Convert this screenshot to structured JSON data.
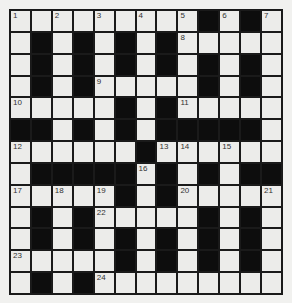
{
  "puzzle": {
    "type": "crossword",
    "size": [
      13,
      13
    ],
    "colors": {
      "white_cell": "#ececea",
      "black_cell": "#0d0d0d",
      "background": "#f1f1ef"
    },
    "grid": [
      [
        0,
        0,
        0,
        0,
        0,
        0,
        0,
        0,
        0,
        1,
        0,
        1,
        0
      ],
      [
        0,
        1,
        0,
        1,
        0,
        1,
        0,
        1,
        0,
        0,
        0,
        0,
        0
      ],
      [
        0,
        1,
        0,
        1,
        0,
        1,
        0,
        1,
        0,
        1,
        0,
        1,
        0
      ],
      [
        0,
        1,
        0,
        1,
        0,
        0,
        0,
        0,
        0,
        1,
        0,
        1,
        0
      ],
      [
        0,
        0,
        0,
        0,
        0,
        1,
        0,
        1,
        0,
        0,
        0,
        0,
        0
      ],
      [
        1,
        1,
        0,
        1,
        0,
        1,
        0,
        1,
        1,
        1,
        1,
        1,
        0
      ],
      [
        0,
        0,
        0,
        0,
        0,
        0,
        1,
        0,
        0,
        0,
        0,
        0,
        0
      ],
      [
        0,
        1,
        1,
        1,
        1,
        1,
        0,
        1,
        0,
        1,
        0,
        1,
        1
      ],
      [
        0,
        0,
        0,
        0,
        0,
        1,
        0,
        1,
        0,
        0,
        0,
        0,
        0
      ],
      [
        0,
        1,
        0,
        1,
        0,
        0,
        0,
        0,
        0,
        1,
        0,
        1,
        0
      ],
      [
        0,
        1,
        0,
        1,
        0,
        1,
        0,
        1,
        0,
        1,
        0,
        1,
        0
      ],
      [
        0,
        0,
        0,
        0,
        0,
        1,
        0,
        1,
        0,
        1,
        0,
        1,
        0
      ],
      [
        0,
        1,
        0,
        1,
        0,
        0,
        0,
        0,
        0,
        0,
        0,
        0,
        0
      ]
    ],
    "numbers": [
      {
        "n": "1",
        "r": 0,
        "c": 0
      },
      {
        "n": "2",
        "r": 0,
        "c": 2
      },
      {
        "n": "3",
        "r": 0,
        "c": 4
      },
      {
        "n": "4",
        "r": 0,
        "c": 6
      },
      {
        "n": "5",
        "r": 0,
        "c": 8
      },
      {
        "n": "6",
        "r": 0,
        "c": 10
      },
      {
        "n": "7",
        "r": 0,
        "c": 12
      },
      {
        "n": "8",
        "r": 1,
        "c": 8
      },
      {
        "n": "9",
        "r": 3,
        "c": 4
      },
      {
        "n": "10",
        "r": 4,
        "c": 0
      },
      {
        "n": "11",
        "r": 4,
        "c": 8
      },
      {
        "n": "12",
        "r": 6,
        "c": 0
      },
      {
        "n": "13",
        "r": 6,
        "c": 7
      },
      {
        "n": "14",
        "r": 6,
        "c": 8
      },
      {
        "n": "15",
        "r": 6,
        "c": 10
      },
      {
        "n": "16",
        "r": 7,
        "c": 6
      },
      {
        "n": "17",
        "r": 8,
        "c": 0
      },
      {
        "n": "18",
        "r": 8,
        "c": 2
      },
      {
        "n": "19",
        "r": 8,
        "c": 4
      },
      {
        "n": "20",
        "r": 8,
        "c": 8
      },
      {
        "n": "21",
        "r": 8,
        "c": 12
      },
      {
        "n": "22",
        "r": 9,
        "c": 4
      },
      {
        "n": "23",
        "r": 11,
        "c": 0
      },
      {
        "n": "24",
        "r": 12,
        "c": 4
      }
    ]
  }
}
